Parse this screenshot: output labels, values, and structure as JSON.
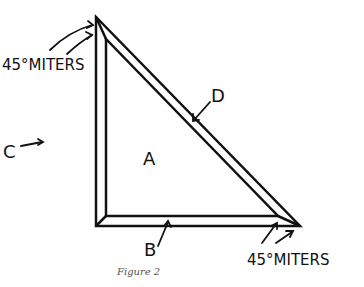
{
  "figure": {
    "caption": "Figure 2",
    "labels": {
      "miters_top": "45°MITERS",
      "miters_bottom": "45°MITERS",
      "a": "A",
      "b": "B",
      "c": "C",
      "d": "D"
    },
    "stroke_color": "#111111",
    "background": "#ffffff"
  }
}
